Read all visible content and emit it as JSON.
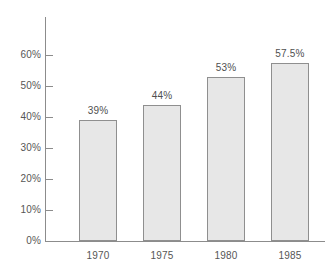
{
  "chart_data": {
    "type": "bar",
    "title": "",
    "subtitle": "",
    "xlabel": "",
    "ylabel": "",
    "categories": [
      "1970",
      "1975",
      "1980",
      "1985"
    ],
    "values": [
      39,
      44,
      53,
      57.5
    ],
    "data_labels": [
      "39%",
      "44%",
      "53%",
      "57.5%"
    ],
    "ylim": [
      0,
      60
    ],
    "ytick_values": [
      0,
      10,
      20,
      30,
      40,
      50,
      60
    ],
    "ytick_labels": [
      "0%",
      "10%",
      "20%",
      "30%",
      "40%",
      "50%",
      "60%"
    ],
    "grid": false,
    "legend": false,
    "legend_position": "none",
    "bar_fill_color": "#e7e7e7",
    "bar_border_color": "#8f8f8f",
    "axis_color": "#8c8c8c",
    "label_color": "#565656"
  }
}
